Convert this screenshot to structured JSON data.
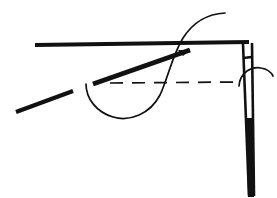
{
  "figure": {
    "width": 277,
    "height": 198,
    "background_color": "#ffffff",
    "ink_color": "#111111",
    "stroke_styles": {
      "thick": 4.0,
      "medium": 2.6,
      "thin": 1.6,
      "dashed_pattern": "13 9"
    },
    "elements": [
      {
        "id": "fabric-edge-top",
        "name": "top-edge-line",
        "kind": "line",
        "description": "long thick horizontal rule forming the fabric edge",
        "weight": "thick",
        "path": "M 35 45 L 249 42"
      },
      {
        "id": "needle-shaft-left",
        "name": "needle-shaft-left-line",
        "kind": "line",
        "description": "left side of the narrow vertical needle body",
        "weight": "medium",
        "path": "M 243 44 L 249 196"
      },
      {
        "id": "needle-shaft-right",
        "name": "needle-shaft-right-line",
        "kind": "line",
        "description": "right side of the narrow vertical needle body",
        "weight": "medium",
        "path": "M 252 43 L 254 196"
      },
      {
        "id": "needle-eye-cap",
        "name": "needle-eye-cap-line",
        "kind": "line",
        "description": "short horizontal cap closing the top of the needle",
        "weight": "medium",
        "path": "M 243 58 L 252 57"
      },
      {
        "id": "needle-tip-fill",
        "name": "needle-tip-taper",
        "kind": "polygon",
        "description": "solid tapering lower portion of the needle",
        "weight": "thick",
        "path": "M 246 118 L 252 118 L 254 197 L 248 197 Z"
      },
      {
        "id": "thread-arrow",
        "name": "thread-direction-arrow",
        "kind": "arrow",
        "description": "thick tapered stroke with arrowhead pointing up-right toward the needle",
        "weight": "thick",
        "path": "M 93 84 L 190 50",
        "head": "M 190 50 L 178 50 L 183 56 Z"
      },
      {
        "id": "thread-tail",
        "name": "thread-tail-stroke",
        "kind": "line",
        "description": "short thick diagonal stroke at lower left, continuation of the thread",
        "weight": "thick",
        "path": "M 16 112 L 73 91"
      },
      {
        "id": "thread-loop",
        "name": "thread-loop-curve",
        "kind": "curve",
        "description": "large hooked S-curve of thread looping under and crossing the top edge",
        "weight": "thin",
        "path": "M 225 13 C 205 14 192 24 183 38 C 172 56 168 78 160 95 C 150 114 130 122 113 117 C 96 112 86 98 86 84"
      },
      {
        "id": "seam-guide",
        "name": "seam-guide-dashed-line",
        "kind": "dashed-line",
        "description": "horizontal dashed construction / seam guide line",
        "weight": "thin",
        "path": "M 110 83 L 238 82"
      },
      {
        "id": "rotation-arc",
        "name": "rotation-arc",
        "kind": "curve",
        "description": "small arc sweeping over the needle indicating rotation",
        "weight": "thin",
        "path": "M 239 86 C 240 72 252 66 261 68 C 267 69 271 72 273 76"
      }
    ]
  }
}
